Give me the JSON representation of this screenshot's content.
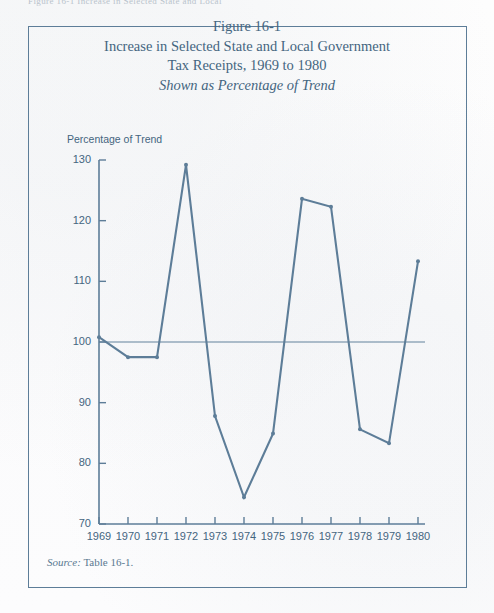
{
  "page": {
    "cropped_header_text": "Figure 16-1   Increase in Selected State and Local",
    "border_color": "#5d7d98",
    "ink_color": "#44657f"
  },
  "figure": {
    "title_line1": "Figure 16-1",
    "title_line2": "Increase in Selected State and Local Government",
    "title_line3": "Tax Receipts, 1969 to 1980",
    "title_line4": "Shown as Percentage of Trend",
    "source_lead": "Source:",
    "source_text": "Table 16-1."
  },
  "chart_data": {
    "type": "line",
    "title": "Increase in Selected State and Local Government Tax Receipts, 1969 to 1980",
    "subtitle": "Shown as Percentage of Trend",
    "xlabel": "",
    "ylabel": "Percentage of Trend",
    "x": [
      1969,
      1970,
      1971,
      1972,
      1973,
      1974,
      1975,
      1976,
      1977,
      1978,
      1979,
      1980
    ],
    "categories": [
      "1969",
      "1970",
      "1971",
      "1972",
      "1973",
      "1974",
      "1975",
      "1976",
      "1977",
      "1978",
      "1979",
      "1980"
    ],
    "values": [
      100.8,
      97.5,
      97.5,
      129.2,
      87.8,
      74.4,
      84.9,
      123.6,
      122.3,
      85.6,
      83.3,
      113.3
    ],
    "series": [
      {
        "name": "Tax receipts as percentage of trend",
        "values": [
          100.8,
          97.5,
          97.5,
          129.2,
          87.8,
          74.4,
          84.9,
          123.6,
          122.3,
          85.6,
          83.3,
          113.3
        ]
      }
    ],
    "ylim": [
      70,
      130
    ],
    "yticks": [
      70,
      80,
      90,
      100,
      110,
      120,
      130
    ],
    "ytick_labels": [
      "70",
      "80",
      "90",
      "100",
      "110",
      "120",
      "130"
    ],
    "xlim": [
      1969,
      1980
    ],
    "xticks": [
      1969,
      1970,
      1971,
      1972,
      1973,
      1974,
      1975,
      1976,
      1977,
      1978,
      1979,
      1980
    ],
    "xtick_labels": [
      "1969",
      "1970",
      "1971",
      "1972",
      "1973",
      "1974",
      "1975",
      "1976",
      "1977",
      "1978",
      "1979",
      "1980"
    ],
    "reference_line": {
      "value": 100,
      "label": "trend (100)"
    },
    "grid": false,
    "legend": "none",
    "line_color": "#5d7d98",
    "marker": "dot"
  }
}
